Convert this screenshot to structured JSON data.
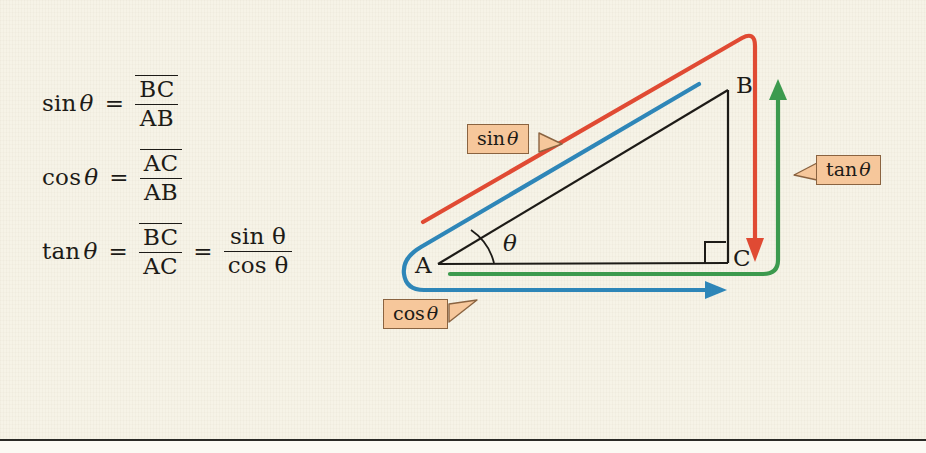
{
  "page": {
    "background_color": "#f6f3e7",
    "rule_color": "#2a2a26"
  },
  "formulas": [
    {
      "id": "sin-formula",
      "function": "sin",
      "theta": "θ",
      "equals": "=",
      "numerator": "BC",
      "denominator": "AB",
      "second_equals": "",
      "second_numerator": "",
      "second_denominator": ""
    },
    {
      "id": "cos-formula",
      "function": "cos",
      "theta": "θ",
      "equals": "=",
      "numerator": "AC",
      "denominator": "AB",
      "second_equals": "",
      "second_numerator": "",
      "second_denominator": ""
    },
    {
      "id": "tan-formula",
      "function": "tan",
      "theta": "θ",
      "equals": "=",
      "numerator": "BC",
      "denominator": "AC",
      "second_equals": "=",
      "second_numerator": "sin θ",
      "second_denominator": "cos θ"
    }
  ],
  "diagram": {
    "vertices": [
      {
        "name": "A",
        "label": "A",
        "x": 438,
        "y": 264
      },
      {
        "name": "B",
        "label": "B",
        "x": 728,
        "y": 90
      },
      {
        "name": "C",
        "label": "C",
        "x": 728,
        "y": 263
      }
    ],
    "angle_label": "θ",
    "right_angle_marker": true,
    "callouts": [
      {
        "id": "sin-callout",
        "label": "sin",
        "theta": "θ",
        "x": 467,
        "y": 124,
        "pointer": "right"
      },
      {
        "id": "cos-callout",
        "label": "cos",
        "theta": "θ",
        "x": 383,
        "y": 299,
        "pointer": "right"
      },
      {
        "id": "tan-callout",
        "label": "tan",
        "theta": "θ",
        "x": 816,
        "y": 155,
        "pointer": "left"
      }
    ],
    "traces": [
      {
        "id": "sin-trace",
        "color": "#e04a33",
        "describes": "BC over AB",
        "arrow": "down-at-C"
      },
      {
        "id": "cos-trace",
        "color": "#2e86b8",
        "describes": "AC over AB",
        "arrow": "right-at-C"
      },
      {
        "id": "tan-trace",
        "color": "#3c9a4e",
        "describes": "BC over AC",
        "arrow": "up-at-C"
      }
    ],
    "colors": {
      "sin": "#e04a33",
      "cos": "#2e86b8",
      "tan": "#3c9a4e",
      "triangle": "#1d1b17",
      "callout_fill": "#f6c79b",
      "callout_border": "#8a6340"
    }
  }
}
